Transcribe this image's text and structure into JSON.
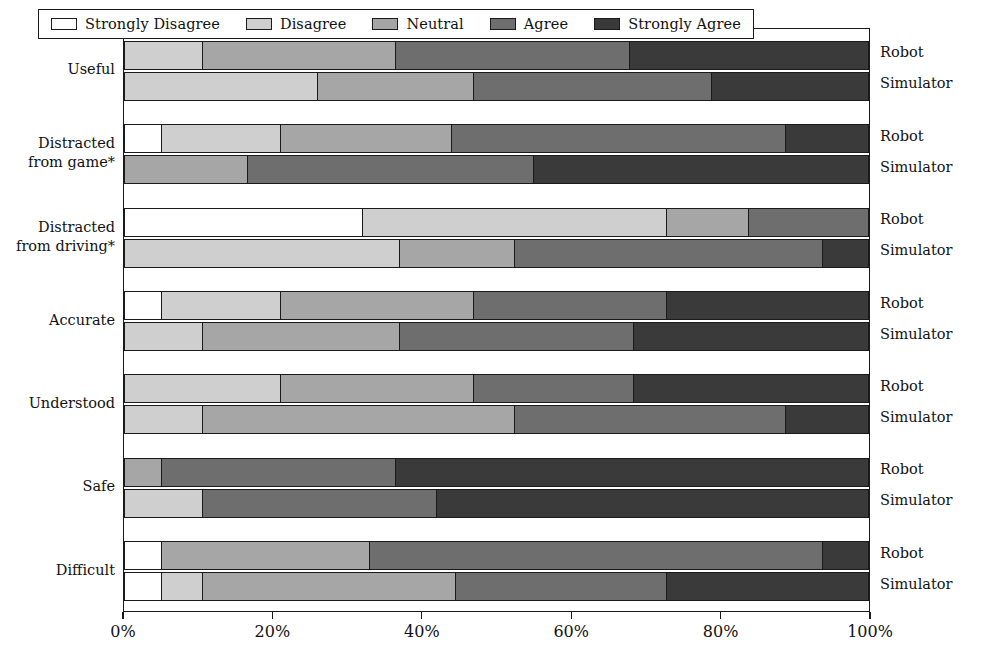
{
  "chart_data": {
    "type": "bar",
    "subtype": "stacked-horizontal-diverging-likert",
    "title": "",
    "xlabel": "",
    "ylabel": "",
    "xlim": [
      0,
      100
    ],
    "xticks": [
      "0%",
      "20%",
      "40%",
      "60%",
      "80%",
      "100%"
    ],
    "xtick_values": [
      0,
      20,
      40,
      60,
      80,
      100
    ],
    "grid": false,
    "legend_position": "top",
    "legend": [
      {
        "label": "Strongly Disagree",
        "color": "#ffffff"
      },
      {
        "label": "Disagree",
        "color": "#cfcfcf"
      },
      {
        "label": "Neutral",
        "color": "#a6a6a6"
      },
      {
        "label": "Agree",
        "color": "#6e6e6e"
      },
      {
        "label": "Strongly Agree",
        "color": "#3a3a3a"
      }
    ],
    "series_names": [
      "Robot",
      "Simulator"
    ],
    "categories": [
      "Useful",
      "Distracted from game*",
      "Distracted from driving*",
      "Accurate",
      "Understood",
      "Safe",
      "Difficult"
    ],
    "groups": [
      {
        "category": "Useful",
        "category_lines": [
          "Useful"
        ],
        "bars": [
          {
            "series": "Robot",
            "values": [
              0.0,
              10.5,
              26.0,
              31.5,
              32.0
            ]
          },
          {
            "series": "Simulator",
            "values": [
              0.0,
              26.0,
              21.0,
              32.0,
              21.0
            ]
          }
        ]
      },
      {
        "category": "Distracted from game*",
        "category_lines": [
          "Distracted",
          "from game*"
        ],
        "bars": [
          {
            "series": "Robot",
            "values": [
              5.0,
              16.0,
              23.0,
              45.0,
              11.0
            ]
          },
          {
            "series": "Simulator",
            "values": [
              0.0,
              0.0,
              16.5,
              38.5,
              45.0
            ]
          }
        ]
      },
      {
        "category": "Distracted from driving*",
        "category_lines": [
          "Distracted",
          "from driving*"
        ],
        "bars": [
          {
            "series": "Robot",
            "values": [
              32.0,
              41.0,
              11.0,
              16.0,
              0.0
            ]
          },
          {
            "series": "Simulator",
            "values": [
              0.0,
              37.0,
              15.5,
              41.5,
              6.0
            ]
          }
        ]
      },
      {
        "category": "Accurate",
        "category_lines": [
          "Accurate"
        ],
        "bars": [
          {
            "series": "Robot",
            "values": [
              5.0,
              16.0,
              26.0,
              26.0,
              27.0
            ]
          },
          {
            "series": "Simulator",
            "values": [
              0.0,
              10.5,
              26.5,
              31.5,
              31.5
            ]
          }
        ]
      },
      {
        "category": "Understood",
        "category_lines": [
          "Understood"
        ],
        "bars": [
          {
            "series": "Robot",
            "values": [
              0.0,
              21.0,
              26.0,
              21.5,
              31.5
            ]
          },
          {
            "series": "Simulator",
            "values": [
              0.0,
              10.5,
              42.0,
              36.5,
              11.0
            ]
          }
        ]
      },
      {
        "category": "Safe",
        "category_lines": [
          "Safe"
        ],
        "bars": [
          {
            "series": "Robot",
            "values": [
              0.0,
              0.0,
              5.0,
              31.5,
              63.5
            ]
          },
          {
            "series": "Simulator",
            "values": [
              0.0,
              10.5,
              0.0,
              31.5,
              58.0
            ]
          }
        ]
      },
      {
        "category": "Difficult",
        "category_lines": [
          "Difficult"
        ],
        "bars": [
          {
            "series": "Robot",
            "values": [
              5.0,
              0.0,
              28.0,
              61.0,
              6.0
            ]
          },
          {
            "series": "Simulator",
            "values": [
              5.0,
              5.5,
              34.0,
              28.5,
              27.0
            ]
          }
        ]
      }
    ]
  }
}
